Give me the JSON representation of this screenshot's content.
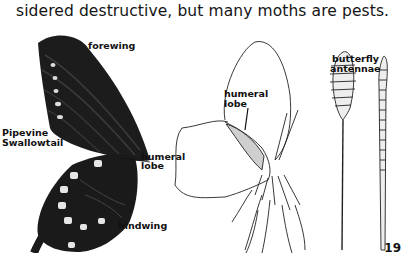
{
  "page": {
    "body_text": "sidered destructive, but many moths are pests.",
    "page_number": "19"
  },
  "figure_left": {
    "species_label_line1": "Pipevine",
    "species_label_line2": "Swallowtail",
    "forewing_label": "forewing",
    "hindwing_label": "hindwing",
    "humeral_label_line1": "humeral",
    "humeral_label_line2": "lobe"
  },
  "figure_center": {
    "humeral_label_line1": "humeral",
    "humeral_label_line2": "lobe"
  },
  "figure_right": {
    "title_line1": "butterfly",
    "title_line2": "antennae"
  }
}
